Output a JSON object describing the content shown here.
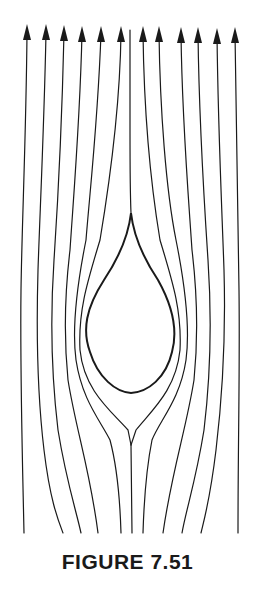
{
  "figure": {
    "caption": "FIGURE 7.51",
    "colors": {
      "line": "#1a1a1a",
      "background": "#ffffff"
    },
    "arrow_x": [
      27,
      46,
      64,
      82,
      101,
      121,
      143,
      159,
      181,
      198,
      217,
      235
    ],
    "center_line_x": 130,
    "streamline_count": 12
  }
}
